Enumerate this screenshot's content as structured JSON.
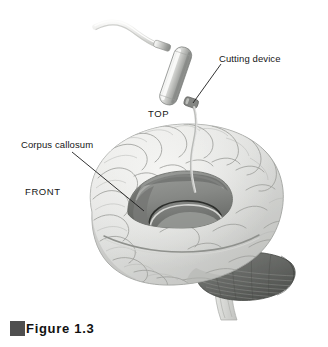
{
  "figure": {
    "caption": "Figure 1.3",
    "caption_swatch_color": "#4f4f4f"
  },
  "labels": {
    "cutting_device": "Cutting device",
    "corpus_callosum": "Corpus callosum",
    "top": "TOP",
    "front": "FRONT"
  },
  "icons": {
    "cutting_device": "surgical-probe-icon",
    "brain": "brain-lateral-icon",
    "cerebellum": "cerebellum-icon",
    "brainstem": "brainstem-icon",
    "corpus_callosum": "corpus-callosum-icon",
    "cable": "probe-cable-icon"
  },
  "colors": {
    "background": "#ffffff",
    "cortex_light": "#e3e4e2",
    "cortex_mid": "#cfd0cd",
    "cortex_shadow": "#b2b3b0",
    "sulci_line": "#a3a5a1",
    "corpus_callosum": "#8d8f8c",
    "corpus_callosum_dark": "#6f716e",
    "cerebellum": "#6b6d6a",
    "cerebellum_dark": "#4d4f4c",
    "brainstem": "#d3d4d1",
    "probe_body_light": "#f2f2f1",
    "probe_body_mid": "#c8c9c6",
    "probe_body_dark": "#8e908d",
    "probe_tip": "#7a7c79",
    "cable": "#e6e6e4",
    "leader_line": "#1c1c1c",
    "text": "#161616"
  }
}
